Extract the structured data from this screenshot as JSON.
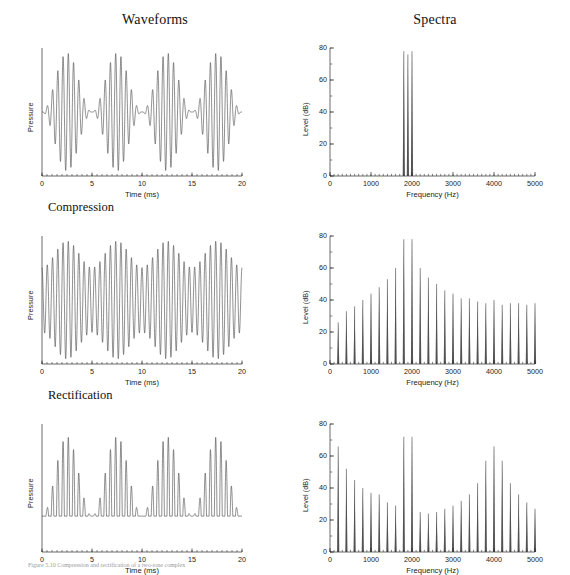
{
  "figure": {
    "column_titles": {
      "waveforms": "Waveforms",
      "spectra": "Spectra"
    },
    "row_labels": {
      "row1": "",
      "row2": "Compression",
      "row3": "Rectification"
    },
    "caption": "Figure  5.10  Compression and rectification of a two-tone complex"
  },
  "axes": {
    "waveform": {
      "xlabel": "Time (ms)",
      "ylabel": "Pressure",
      "xticks": [
        "0",
        "5",
        "10",
        "15",
        "20"
      ],
      "xlim": [
        0,
        20
      ],
      "yticks": []
    },
    "spectrum": {
      "xlabel": "Frequency (Hz)",
      "ylabel": "Level (dB)",
      "xticks": [
        "0",
        "1000",
        "2000",
        "3000",
        "4000",
        "5000"
      ],
      "yticks": [
        "0",
        "20",
        "40",
        "60",
        "80"
      ],
      "xlim": [
        0,
        5000
      ],
      "ylim": [
        0,
        80
      ]
    }
  },
  "chart_data": [
    {
      "id": "waveform-original",
      "type": "line",
      "title": "",
      "xlabel": "Time (ms)",
      "ylabel": "Pressure",
      "xlim": [
        0,
        20
      ],
      "ylim": [
        -1.15,
        1.15
      ],
      "grid": false,
      "description": "Amplitude-modulated two-tone beat pattern, full modulation depth",
      "components_hz": [
        1800,
        1900,
        2000
      ],
      "beat_rate_hz": 200,
      "modulation_depth": 1.0
    },
    {
      "id": "spectrum-original",
      "type": "bar",
      "title": "",
      "xlabel": "Frequency (Hz)",
      "ylabel": "Level (dB)",
      "xlim": [
        0,
        5000
      ],
      "ylim": [
        0,
        80
      ],
      "grid": false,
      "x": [
        1800,
        1900,
        2000
      ],
      "values": [
        78,
        76,
        78
      ]
    },
    {
      "id": "waveform-compression",
      "type": "line",
      "title": "Compression",
      "xlabel": "Time (ms)",
      "ylabel": "Pressure",
      "xlim": [
        0,
        20
      ],
      "ylim": [
        -1.15,
        1.15
      ],
      "grid": false,
      "description": "Compressed beat pattern, reduced modulation depth",
      "components_hz": [
        1800,
        1900,
        2000
      ],
      "beat_rate_hz": 200,
      "modulation_depth": 0.45
    },
    {
      "id": "spectrum-compression",
      "type": "bar",
      "title": "",
      "xlabel": "Frequency (Hz)",
      "ylabel": "Level (dB)",
      "xlim": [
        0,
        5000
      ],
      "ylim": [
        0,
        80
      ],
      "grid": false,
      "x": [
        200,
        400,
        600,
        800,
        1000,
        1200,
        1400,
        1600,
        1800,
        2000,
        2200,
        2400,
        2600,
        2800,
        3000,
        3200,
        3400,
        3600,
        3800,
        4000,
        4200,
        4400,
        4600,
        4800,
        5000
      ],
      "values": [
        26,
        33,
        36,
        40,
        44,
        48,
        53,
        60,
        78,
        78,
        60,
        54,
        50,
        46,
        44,
        41,
        41,
        39,
        38,
        40,
        37,
        38,
        38,
        37,
        38
      ]
    },
    {
      "id": "waveform-rectification",
      "type": "line",
      "title": "Rectification",
      "xlabel": "Time (ms)",
      "ylabel": "Pressure",
      "xlim": [
        0,
        20
      ],
      "ylim": [
        -1.15,
        1.15
      ],
      "grid": false,
      "description": "Half-wave rectified beat pattern, positive lobes only above flat baseline",
      "components_hz": [
        1800,
        1900,
        2000
      ],
      "beat_rate_hz": 200,
      "modulation_depth": 1.0
    },
    {
      "id": "spectrum-rectification",
      "type": "bar",
      "title": "",
      "xlabel": "Frequency (Hz)",
      "ylabel": "Level (dB)",
      "xlim": [
        0,
        5000
      ],
      "ylim": [
        0,
        80
      ],
      "grid": false,
      "x": [
        200,
        400,
        600,
        800,
        1000,
        1200,
        1400,
        1600,
        1800,
        2000,
        2200,
        2400,
        2600,
        2800,
        3000,
        3200,
        3400,
        3600,
        3800,
        4000,
        4200,
        4400,
        4600,
        4800,
        5000
      ],
      "values": [
        66,
        52,
        45,
        40,
        37,
        36,
        31,
        29,
        72,
        72,
        25,
        24,
        25,
        27,
        29,
        32,
        36,
        43,
        57,
        66,
        57,
        43,
        36,
        31,
        27
      ]
    }
  ]
}
